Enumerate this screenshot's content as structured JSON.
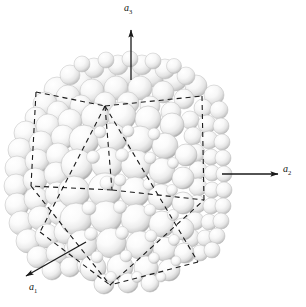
{
  "figure": {
    "background_color": "#ffffff",
    "width": 306,
    "height": 307
  },
  "axes": {
    "color": "#1a1a1a",
    "items": [
      {
        "id": "a3",
        "label": "a",
        "subscript": "3",
        "direction": "up",
        "arrow": {
          "x1": 131,
          "y1": 80,
          "x2": 131,
          "y2": 28
        }
      },
      {
        "id": "a2",
        "label": "a",
        "subscript": "2",
        "direction": "right",
        "arrow": {
          "x1": 222,
          "y1": 174,
          "x2": 280,
          "y2": 174
        }
      },
      {
        "id": "a1",
        "label": "a",
        "subscript": "1",
        "direction": "down-left",
        "arrow": {
          "x1": 86,
          "y1": 242,
          "x2": 24,
          "y2": 277
        }
      }
    ]
  },
  "unit_cell": {
    "line_style": "dashed",
    "color": "#1a1a1a",
    "stroke_width": 1.1,
    "dash_pattern": "5,4",
    "vertices": {
      "top": [
        105,
        106
      ],
      "top_left": [
        36,
        92
      ],
      "top_right": [
        202,
        96
      ],
      "left": [
        31,
        186
      ],
      "right": [
        204,
        200
      ],
      "bottom": [
        110,
        285
      ],
      "bottom_left": [
        40,
        232
      ],
      "bottom_right": [
        198,
        262
      ],
      "center_front": [
        112,
        190
      ]
    }
  },
  "spheres": {
    "count": 238,
    "fill_light": "#ffffff",
    "fill_mid": "#e9e9e9",
    "fill_shadow": "#9a9a9a",
    "outline": "#bdbdbd",
    "highlight_offset": "up-left",
    "description": "close-packed atoms, larger in front face, smaller toward back and right face"
  },
  "cluster_bounds": {
    "left": 13,
    "top": 62,
    "right": 230,
    "bottom": 290
  }
}
